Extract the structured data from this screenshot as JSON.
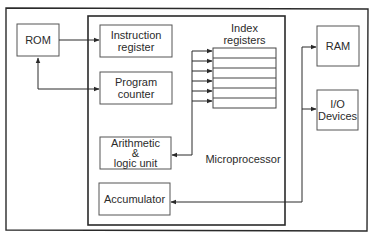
{
  "diagram": {
    "title": "Microprocessor",
    "colors": {
      "line": "#2a2a2a",
      "box_fill": "#ffffff",
      "background": "#ffffff"
    },
    "external": {
      "rom": {
        "label": "ROM"
      },
      "ram": {
        "label": "RAM"
      },
      "io": {
        "line1": "I/O",
        "line2": "Devices"
      }
    },
    "internal": {
      "instruction_register": {
        "line1": "Instruction",
        "line2": "register"
      },
      "program_counter": {
        "line1": "Program",
        "line2": "counter"
      },
      "alu": {
        "line1": "Arithmetic",
        "line2": "&",
        "line3": "logic unit"
      },
      "accumulator": {
        "label": "Accumulator"
      },
      "index_registers": {
        "line1": "Index",
        "line2": "registers",
        "row_count": 6
      }
    },
    "connections": [
      {
        "from": "ROM",
        "to": "Instruction register",
        "type": "one-way"
      },
      {
        "from": "ROM",
        "to": "Program counter",
        "type": "two-way"
      },
      {
        "from": "Arithmetic & logic unit",
        "to": "Index registers",
        "type": "bus"
      },
      {
        "from": "Accumulator",
        "to": "RAM",
        "type": "bus"
      },
      {
        "from": "Accumulator",
        "to": "I/O Devices",
        "type": "bus"
      }
    ]
  }
}
